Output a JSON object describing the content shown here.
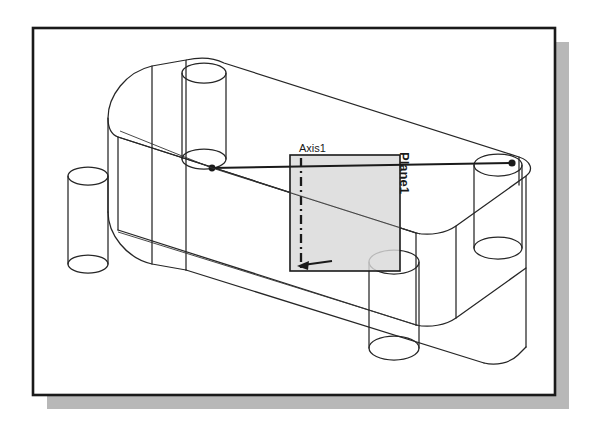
{
  "viewport": {
    "width": 589,
    "height": 424,
    "background_color": "#ffffff"
  },
  "drawing_frame": {
    "name": "graphics-viewport-frame",
    "x": 33,
    "y": 28,
    "width": 522,
    "height": 367,
    "border_color": "#1a1a1a",
    "fill_color": "#ffffff",
    "shadow_color": "#8c8c8c",
    "shadow_offset": 14
  },
  "model": {
    "type": "wireframe-solid",
    "description": "rectangular plate with four cylindrical bosses",
    "line_color": "#262626",
    "cylinders": [
      {
        "name": "cylinder-back-left",
        "cx": 88,
        "top_cy": 176,
        "bottom_cy": 264,
        "rx": 20,
        "ry": 9
      },
      {
        "name": "cylinder-back-right",
        "cx": 204,
        "top_cy": 72,
        "bottom_cy": 159,
        "rx": 22,
        "ry": 10
      },
      {
        "name": "cylinder-front-right",
        "cx": 498,
        "top_cy": 165,
        "bottom_cy": 248,
        "rx": 24,
        "ry": 11
      },
      {
        "name": "cylinder-front-left",
        "cx": 394,
        "top_cy": 262,
        "bottom_cy": 348,
        "rx": 25,
        "ry": 12
      }
    ]
  },
  "reference_geometry": {
    "plane": {
      "name": "reference-plane",
      "label": "Plane1",
      "label_rotation_deg": 90,
      "x": 290,
      "y": 155,
      "width": 110,
      "height": 116,
      "fill_color": "#d9d9d9",
      "fill_opacity": 0.85,
      "border_color": "#1a1a1a",
      "selected": true
    },
    "axis": {
      "name": "reference-axis",
      "label": "Axis1",
      "style": "dash-dot",
      "color": "#1a1a1a",
      "start": {
        "x": 301,
        "y": 158
      },
      "end": {
        "x": 301,
        "y": 268
      }
    },
    "leader_line": {
      "name": "axis-leader-line",
      "from": {
        "x": 212,
        "y": 168
      },
      "to": {
        "x": 512,
        "y": 163
      },
      "endpoint_marker": "filled-dot"
    },
    "direction_arrow": {
      "name": "plane-direction-arrow",
      "from": {
        "x": 330,
        "y": 262
      },
      "to": {
        "x": 298,
        "y": 266
      }
    }
  },
  "labels": {
    "axis_label": "Axis1",
    "plane_label": "Plane1"
  },
  "colors": {
    "accent": "#1a1a1a",
    "plane_fill": "#d9d9d9",
    "shadow": "#8c8c8c",
    "edge": "#262626"
  }
}
